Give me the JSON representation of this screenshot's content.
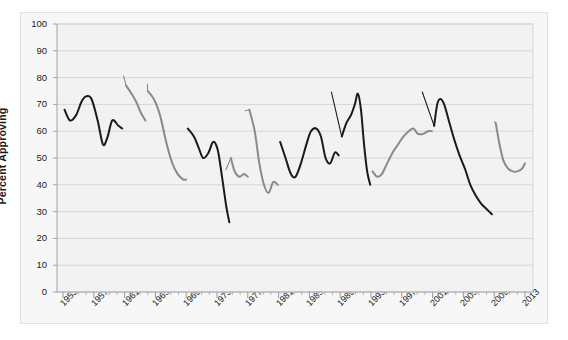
{
  "chart_data": {
    "type": "line",
    "title": "",
    "xlabel": "",
    "ylabel": "Percent Approving",
    "ylim": [
      0,
      100
    ],
    "xlim": [
      1953,
      2013
    ],
    "ytick_step": 10,
    "xtick_step": 4,
    "grid": true,
    "legend": "inline-annotations",
    "yticks": [
      "100",
      "90",
      "80",
      "70",
      "60",
      "50",
      "40",
      "30",
      "20",
      "10",
      "0"
    ],
    "xticks": [
      "1953",
      "1957",
      "1961",
      "1965",
      "1969",
      "1973",
      "1977",
      "1981",
      "1985",
      "1989",
      "1993",
      "1997",
      "2001",
      "2005",
      "2009",
      "2013"
    ],
    "colors": {
      "odd_term_series": "#1a1a1a",
      "even_term_series": "#8a8a8a",
      "gridline": "#cfcfcf",
      "axis": "#9a9a9a",
      "plot_background": "#f2f2f2",
      "figure_background": "#f7f7f7"
    },
    "series": [
      {
        "name": "Eisenhower",
        "color": "#1a1a1a",
        "label_x": 1955.2,
        "label_y": 76,
        "points": [
          [
            1953.2,
            68
          ],
          [
            1953.9,
            64
          ],
          [
            1954.7,
            66
          ],
          [
            1955.4,
            71
          ],
          [
            1956.0,
            73
          ],
          [
            1956.7,
            72
          ],
          [
            1957.5,
            64
          ],
          [
            1958.2,
            55
          ],
          [
            1958.8,
            58
          ],
          [
            1959.4,
            64
          ],
          [
            1960.2,
            62
          ],
          [
            1960.7,
            61
          ]
        ]
      },
      {
        "name": "Kennedy",
        "color": "#8a8a8a",
        "label_x": 1960.6,
        "label_y": 81,
        "points": [
          [
            1961.2,
            77
          ],
          [
            1961.9,
            74
          ],
          [
            1962.5,
            71
          ],
          [
            1963.1,
            67
          ],
          [
            1963.7,
            64
          ]
        ]
      },
      {
        "name": "Johnson",
        "color": "#8a8a8a",
        "label_x": 1963.7,
        "label_y": 78,
        "points": [
          [
            1964.0,
            75
          ],
          [
            1964.8,
            72
          ],
          [
            1965.6,
            66
          ],
          [
            1966.4,
            56
          ],
          [
            1967.2,
            48
          ],
          [
            1967.9,
            44
          ],
          [
            1968.6,
            42
          ],
          [
            1969.0,
            42
          ]
        ]
      },
      {
        "name": "Nixon",
        "color": "#1a1a1a",
        "label_x": 1968.6,
        "label_y": 63,
        "points": [
          [
            1969.2,
            61
          ],
          [
            1970.0,
            58
          ],
          [
            1970.6,
            54
          ],
          [
            1971.2,
            50
          ],
          [
            1971.9,
            52
          ],
          [
            1972.5,
            56
          ],
          [
            1973.1,
            53
          ],
          [
            1973.7,
            42
          ],
          [
            1974.2,
            32
          ],
          [
            1974.6,
            26
          ]
        ]
      },
      {
        "name": "Ford",
        "color": "#8a8a8a",
        "label_x": 1973.9,
        "label_y": 46,
        "points": [
          [
            1974.8,
            50
          ],
          [
            1975.3,
            45
          ],
          [
            1975.9,
            43
          ],
          [
            1976.5,
            44
          ],
          [
            1977.0,
            43
          ]
        ]
      },
      {
        "name": "Carter",
        "color": "#8a8a8a",
        "label_x": 1976.4,
        "label_y": 68,
        "points": [
          [
            1977.2,
            68
          ],
          [
            1977.9,
            60
          ],
          [
            1978.5,
            48
          ],
          [
            1979.1,
            40
          ],
          [
            1979.7,
            37
          ],
          [
            1980.3,
            41
          ],
          [
            1980.9,
            40
          ]
        ]
      },
      {
        "name": "Reagan",
        "color": "#1a1a1a",
        "label_x": 1982.0,
        "label_y": 62,
        "points": [
          [
            1981.2,
            56
          ],
          [
            1981.9,
            50
          ],
          [
            1982.6,
            44
          ],
          [
            1983.2,
            43
          ],
          [
            1983.9,
            48
          ],
          [
            1984.6,
            55
          ],
          [
            1985.2,
            60
          ],
          [
            1985.9,
            61
          ],
          [
            1986.5,
            58
          ],
          [
            1987.1,
            50
          ],
          [
            1987.7,
            48
          ],
          [
            1988.3,
            52
          ],
          [
            1988.8,
            51
          ]
        ]
      },
      {
        "name": "Bush Sr.",
        "color": "#1a1a1a",
        "label_x": 1987.6,
        "label_y": 75,
        "points": [
          [
            1989.2,
            58
          ],
          [
            1989.8,
            63
          ],
          [
            1990.4,
            66
          ],
          [
            1990.9,
            70
          ],
          [
            1991.3,
            74
          ],
          [
            1991.7,
            68
          ],
          [
            1992.1,
            55
          ],
          [
            1992.5,
            45
          ],
          [
            1992.9,
            40
          ]
        ]
      },
      {
        "name": "Clinton",
        "color": "#8a8a8a",
        "label_x": 1994.3,
        "label_y": 67,
        "points": [
          [
            1993.2,
            45
          ],
          [
            1993.8,
            43
          ],
          [
            1994.4,
            44
          ],
          [
            1995.1,
            48
          ],
          [
            1995.8,
            52
          ],
          [
            1996.5,
            55
          ],
          [
            1997.2,
            58
          ],
          [
            1997.9,
            60
          ],
          [
            1998.5,
            61
          ],
          [
            1999.1,
            59
          ],
          [
            1999.8,
            59
          ],
          [
            2000.4,
            60
          ],
          [
            2000.9,
            60
          ]
        ]
      },
      {
        "name": "Bush",
        "color": "#1a1a1a",
        "label_x": 1999.4,
        "label_y": 75,
        "points": [
          [
            2001.2,
            62
          ],
          [
            2001.6,
            70
          ],
          [
            2002.0,
            72
          ],
          [
            2002.5,
            70
          ],
          [
            2003.1,
            64
          ],
          [
            2003.8,
            57
          ],
          [
            2004.5,
            51
          ],
          [
            2005.2,
            46
          ],
          [
            2005.9,
            40
          ],
          [
            2006.6,
            36
          ],
          [
            2007.3,
            33
          ],
          [
            2008.0,
            31
          ],
          [
            2008.7,
            29
          ]
        ]
      },
      {
        "name": "Obama",
        "color": "#8a8a8a",
        "label_x": 2008.8,
        "label_y": 64,
        "points": [
          [
            2009.2,
            63
          ],
          [
            2009.7,
            55
          ],
          [
            2010.2,
            49
          ],
          [
            2010.8,
            46
          ],
          [
            2011.4,
            45
          ],
          [
            2012.0,
            45
          ],
          [
            2012.6,
            46
          ],
          [
            2013.0,
            48
          ]
        ]
      }
    ]
  }
}
